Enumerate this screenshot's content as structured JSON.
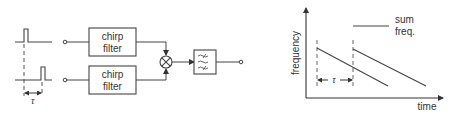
{
  "block_diagram": {
    "filter_top": {
      "line1": "chirp",
      "line2": "filter"
    },
    "filter_bottom": {
      "line1": "chirp",
      "line2": "filter"
    },
    "delay_label": "τ",
    "mixer_icon": "multiplier-icon",
    "lowpass_icon": "lowpass-filter-icon"
  },
  "graph": {
    "ylabel": "frequency",
    "xlabel": "time",
    "delay_label": "τ",
    "annotation_line1": "sum",
    "annotation_line2": "freq."
  },
  "colors": {
    "stroke": "#444444",
    "text": "#333333",
    "background": "#ffffff"
  }
}
